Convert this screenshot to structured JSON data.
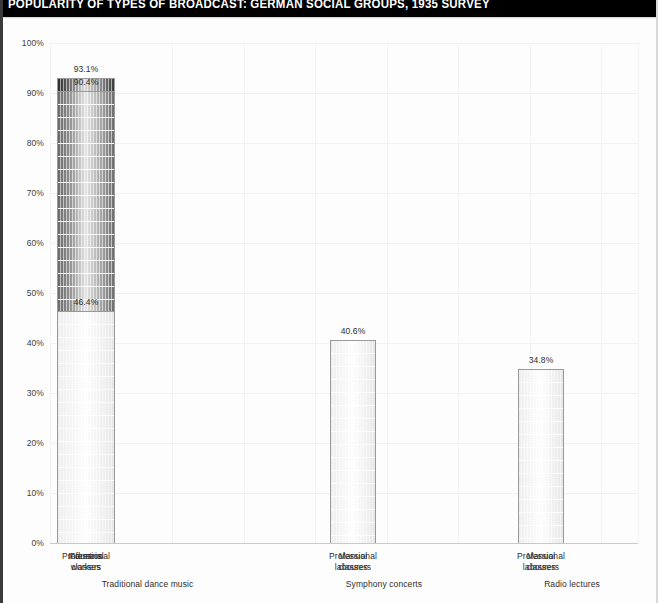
{
  "title": "POPULARITY OF TYPES OF BROADCAST: GERMAN SOCIAL GROUPS, 1935 SURVEY",
  "colors": {
    "banner_bg": "#000000",
    "banner_text": "#ffffff",
    "page_bg": "#fdfdfd",
    "gridline": "#f1f1f1",
    "axis": "#c9c9c9",
    "label_text": "#2e2e2e",
    "bar_dark": "#2b2b2b",
    "bar_mid": "#6a6a6a",
    "bar_light": "#ededed"
  },
  "axis": {
    "y_ticks": [
      "0%",
      "10%",
      "20%",
      "30%",
      "40%",
      "50%",
      "60%",
      "70%",
      "80%",
      "90%",
      "100%"
    ],
    "y_min": 0,
    "y_max": 100,
    "y_label": "",
    "x_label": ""
  },
  "chart_data": {
    "type": "bar",
    "title": "POPULARITY OF TYPES OF BROADCAST: GERMAN SOCIAL GROUPS, 1935 SURVEY",
    "subtitle": "",
    "xlabel": "",
    "ylabel": "",
    "ylim": [
      0,
      100
    ],
    "y_tick_step": 10,
    "y_unit": "%",
    "grid": true,
    "legend": "none",
    "groups": [
      {
        "name": "Traditional dance music",
        "bars": [
          {
            "category": "Industrial workers",
            "label_lines": [
              "Industrial",
              "workers"
            ],
            "value": 93.1,
            "value_label": "93.1%",
            "shade": "dark"
          },
          {
            "category": "Farmers",
            "label_lines": [
              "Farmers"
            ],
            "value": 90.4,
            "value_label": "90.4%",
            "shade": "mid"
          },
          {
            "category": "Professional classes",
            "label_lines": [
              "Professional",
              "classes"
            ],
            "value": 46.4,
            "value_label": "46.4%",
            "shade": "light"
          }
        ]
      },
      {
        "name": "Symphony concerts",
        "bars": [
          {
            "category": "Manual labourers",
            "label_lines": [
              "Manual",
              "labourers"
            ],
            "value": 1.8,
            "value_label": "1.8%",
            "shade": "dark"
          },
          {
            "category": "Professional classes",
            "label_lines": [
              "Professional",
              "classes"
            ],
            "value": 40.6,
            "value_label": "40.6%",
            "shade": "light"
          }
        ]
      },
      {
        "name": "Radio lectures",
        "bars": [
          {
            "category": "Manual labourers",
            "label_lines": [
              "Manual",
              "labourers"
            ],
            "value": 11.9,
            "value_label": "11.9%",
            "shade": "dark"
          },
          {
            "category": "Professional classes",
            "label_lines": [
              "Professional",
              "classes"
            ],
            "value": 34.8,
            "value_label": "34.8%",
            "shade": "light"
          }
        ]
      }
    ]
  }
}
